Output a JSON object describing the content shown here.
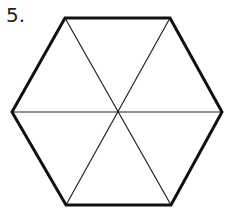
{
  "problem": {
    "number_label": "5."
  },
  "figure": {
    "shape": "regular hexagon divided into 6 triangles",
    "outline_color": "#111111",
    "line_color": "#222222",
    "vertices": [
      [
        65,
        18
      ],
      [
        170,
        18
      ],
      [
        222,
        112
      ],
      [
        171,
        205
      ],
      [
        66,
        205
      ],
      [
        12,
        112
      ]
    ],
    "center": [
      118,
      112
    ]
  }
}
